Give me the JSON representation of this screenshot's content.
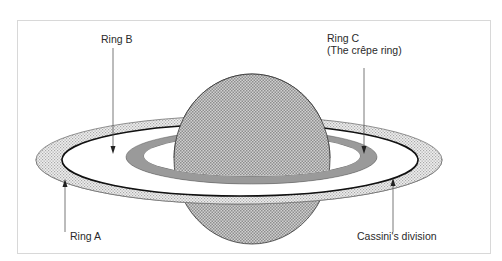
{
  "diagram": {
    "colors": {
      "frame": "#d8d8d8",
      "planet_fill": "#bcbcbc",
      "ring_a_fill": "#e2e2e2",
      "ring_c_fill": "#9a9a9a",
      "outline": "#222222",
      "leader": "#555555"
    },
    "labels": {
      "ring_b": "Ring B",
      "ring_c_line1": "Ring C",
      "ring_c_line2": "(The crêpe ring)",
      "ring_a": "Ring A",
      "cassini": "Cassini's division"
    }
  }
}
